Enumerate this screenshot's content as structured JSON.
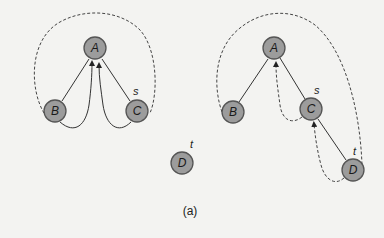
{
  "figure": {
    "caption": "(a)",
    "colors": {
      "background": "#f3f3f1",
      "node_fill": "#9c9c9c",
      "node_stroke": "#555555",
      "edge": "#333333"
    }
  },
  "left_graph": {
    "nodes": [
      {
        "id": "A",
        "label": "A",
        "x": 95,
        "y": 48
      },
      {
        "id": "B",
        "label": "B",
        "x": 55,
        "y": 111
      },
      {
        "id": "C",
        "label": "C",
        "x": 137,
        "y": 111
      },
      {
        "id": "D",
        "label": "D",
        "x": 182,
        "y": 163
      }
    ],
    "annotations": {
      "C": "s",
      "D": "t"
    },
    "edges": [
      {
        "from": "A",
        "to": "B",
        "style": "solid"
      },
      {
        "from": "A",
        "to": "C",
        "style": "solid"
      },
      {
        "from": "B",
        "to": "A",
        "style": "solid-curved-arrow"
      },
      {
        "from": "C",
        "to": "A",
        "style": "solid-curved-arrow"
      },
      {
        "from": "B",
        "to": "C",
        "style": "dashed-loop"
      }
    ]
  },
  "right_graph": {
    "nodes": [
      {
        "id": "A",
        "label": "A",
        "x": 274,
        "y": 48
      },
      {
        "id": "B",
        "label": "B",
        "x": 233,
        "y": 112
      },
      {
        "id": "C",
        "label": "C",
        "x": 311,
        "y": 109
      },
      {
        "id": "D",
        "label": "D",
        "x": 353,
        "y": 170
      }
    ],
    "annotations": {
      "C": "s",
      "D": "t"
    },
    "edges": [
      {
        "from": "A",
        "to": "B",
        "style": "solid"
      },
      {
        "from": "A",
        "to": "C",
        "style": "solid"
      },
      {
        "from": "C",
        "to": "D",
        "style": "solid"
      },
      {
        "from": "C",
        "to": "A",
        "style": "dashed-arrow"
      },
      {
        "from": "D",
        "to": "C",
        "style": "dashed-arrow"
      },
      {
        "from": "B",
        "to": "D",
        "style": "dashed-loop"
      }
    ]
  }
}
